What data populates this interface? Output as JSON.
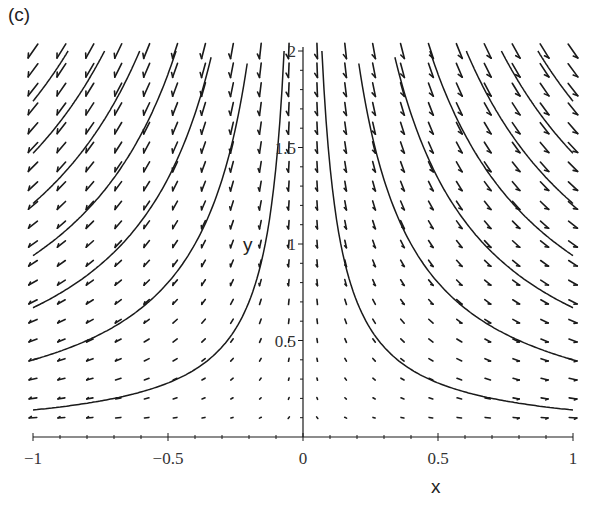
{
  "panel_label": "(c)",
  "chart_data": {
    "type": "vector_field",
    "title": "",
    "panel": "(c)",
    "xlabel": "x",
    "ylabel": "y",
    "xlim": [
      -1,
      1
    ],
    "ylim": [
      0,
      2
    ],
    "grid": false,
    "legend": null,
    "x_ticks": [
      {
        "value": -1,
        "label": "−1"
      },
      {
        "value": -0.5,
        "label": "−0.5"
      },
      {
        "value": 0,
        "label": "0"
      },
      {
        "value": 0.5,
        "label": "0.5"
      },
      {
        "value": 1,
        "label": "1"
      }
    ],
    "x_minor_step": 0.1,
    "y_ticks": [
      {
        "value": 0.5,
        "label": "0.5"
      },
      {
        "value": 1,
        "label": "1"
      },
      {
        "value": 1.5,
        "label": "1.5"
      },
      {
        "value": 2,
        "label": "2"
      }
    ],
    "y_minor_step": 0.1,
    "field": {
      "description": "direction field (dx, dy) = (x, -y); slope dy/dx = -y/x",
      "dx": "x",
      "dy": "-y",
      "grid_x": {
        "from": -1,
        "to": 1,
        "count": 20
      },
      "grid_y": {
        "from": 0.1,
        "to": 2.0,
        "count": 20
      },
      "arrow_scaling": "proportional to magnitude",
      "color": "#1a1a1a"
    },
    "solution_curves": {
      "family": "y = C/|x|",
      "C_values": [
        0.14,
        0.4,
        0.67,
        0.94,
        1.21,
        1.47,
        1.74
      ],
      "branches": [
        "x<0",
        "x>0"
      ],
      "color": "#1a1a1a"
    }
  }
}
